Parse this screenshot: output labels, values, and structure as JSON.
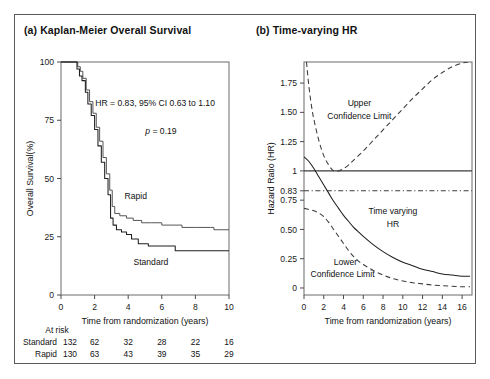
{
  "figure": {
    "panel_a_title": "(a) Kaplan-Meier Overall Survival",
    "panel_b_title": "(b) Time-varying HR"
  },
  "chart_data": [
    {
      "type": "line",
      "panel": "a",
      "title": "(a) Kaplan-Meier Overall Survival",
      "xlabel": "Time from randomization (years)",
      "ylabel": "Overall Survival(%)",
      "xlim": [
        0,
        10
      ],
      "ylim": [
        0,
        100
      ],
      "xticks": [
        0,
        2,
        4,
        6,
        8,
        10
      ],
      "yticks": [
        0,
        25,
        50,
        75,
        100
      ],
      "grid": false,
      "legend_position": "inline-labels",
      "annotations": [
        "HR = 0.83, 95% CI 0.63 to 1.10",
        "p = 0.19"
      ],
      "annotation_hr": "HR = 0.83, 95% CI 0.63 to 1.10",
      "annotation_p_italic": "p",
      "annotation_p_rest": " = 0.19",
      "series": [
        {
          "name": "Rapid",
          "label": "Rapid",
          "style": "solid",
          "points": [
            [
              0.0,
              100
            ],
            [
              0.9,
              100
            ],
            [
              1.0,
              98
            ],
            [
              1.15,
              96
            ],
            [
              1.3,
              93
            ],
            [
              1.5,
              88
            ],
            [
              1.7,
              83
            ],
            [
              1.9,
              78
            ],
            [
              2.1,
              72
            ],
            [
              2.3,
              66
            ],
            [
              2.5,
              59
            ],
            [
              2.7,
              52
            ],
            [
              2.9,
              45
            ],
            [
              3.05,
              38
            ],
            [
              3.2,
              35
            ],
            [
              3.5,
              34
            ],
            [
              3.9,
              33
            ],
            [
              4.3,
              32
            ],
            [
              4.8,
              31
            ],
            [
              5.4,
              31
            ],
            [
              6.0,
              30
            ],
            [
              6.6,
              30
            ],
            [
              7.2,
              29
            ],
            [
              8.0,
              29
            ],
            [
              8.9,
              29
            ],
            [
              9.1,
              28
            ],
            [
              10.0,
              28
            ]
          ]
        },
        {
          "name": "Standard",
          "label": "Standard",
          "style": "solid",
          "points": [
            [
              0.0,
              100
            ],
            [
              0.85,
              100
            ],
            [
              0.95,
              97
            ],
            [
              1.1,
              94
            ],
            [
              1.25,
              92
            ],
            [
              1.45,
              87
            ],
            [
              1.6,
              82
            ],
            [
              1.8,
              77
            ],
            [
              2.0,
              71
            ],
            [
              2.2,
              64
            ],
            [
              2.4,
              57
            ],
            [
              2.6,
              50
            ],
            [
              2.8,
              43
            ],
            [
              2.95,
              33
            ],
            [
              3.1,
              30
            ],
            [
              3.3,
              28
            ],
            [
              3.6,
              27
            ],
            [
              3.9,
              26
            ],
            [
              4.2,
              24
            ],
            [
              4.6,
              22
            ],
            [
              5.2,
              21
            ],
            [
              5.9,
              21
            ],
            [
              6.5,
              21
            ],
            [
              6.8,
              19
            ],
            [
              8.0,
              19
            ],
            [
              10.0,
              19
            ]
          ]
        }
      ],
      "at_risk": {
        "header": "At risk",
        "times": [
          0,
          2,
          4,
          6,
          8,
          10
        ],
        "rows": [
          {
            "label": "Standard",
            "counts": [
              132,
              62,
              32,
              28,
              22,
              16
            ]
          },
          {
            "label": "Rapid",
            "counts": [
              130,
              63,
              43,
              39,
              35,
              29
            ]
          }
        ]
      }
    },
    {
      "type": "line",
      "panel": "b",
      "title": "(b) Time-varying HR",
      "xlabel": "Time from randomization (years)",
      "ylabel": "Hazard Ratio (HR)",
      "xlim": [
        0,
        17
      ],
      "ylim": [
        -0.06,
        1.93
      ],
      "xticks": [
        0,
        2,
        4,
        6,
        8,
        10,
        12,
        14,
        16
      ],
      "yticks": [
        0,
        0.25,
        0.5,
        0.75,
        0.83,
        1,
        1.25,
        1.5,
        1.75
      ],
      "ytick_labels": [
        "0",
        "0.25",
        "0.50",
        "0.75",
        "0.83",
        "1",
        "1.25",
        "1.50",
        "1.75"
      ],
      "grid": false,
      "reference_lines": [
        {
          "name": "null-effect",
          "value": 1,
          "style": "solid"
        },
        {
          "name": "overall-hr",
          "value": 0.83,
          "style": "dash-dot"
        }
      ],
      "series": [
        {
          "name": "Upper Confidence Limit",
          "label": "Upper\nConfidence Limit",
          "label_line1": "Upper",
          "label_line2": "Confidence Limit",
          "style": "dashed",
          "points": [
            [
              0.25,
              1.93
            ],
            [
              0.5,
              1.72
            ],
            [
              0.75,
              1.56
            ],
            [
              1.0,
              1.44
            ],
            [
              1.5,
              1.26
            ],
            [
              2.0,
              1.13
            ],
            [
              2.5,
              1.05
            ],
            [
              3.0,
              1.0
            ],
            [
              3.5,
              1.0
            ],
            [
              4.0,
              1.02
            ],
            [
              4.5,
              1.05
            ],
            [
              5.0,
              1.09
            ],
            [
              6.0,
              1.17
            ],
            [
              7.0,
              1.26
            ],
            [
              8.0,
              1.35
            ],
            [
              9.0,
              1.44
            ],
            [
              10.0,
              1.53
            ],
            [
              11.0,
              1.62
            ],
            [
              12.0,
              1.7
            ],
            [
              13.0,
              1.78
            ],
            [
              14.0,
              1.84
            ],
            [
              15.0,
              1.89
            ],
            [
              16.0,
              1.92
            ],
            [
              16.6,
              1.93
            ]
          ]
        },
        {
          "name": "Time varying HR",
          "label_line1": "Time varying",
          "label_line2": "HR",
          "style": "solid",
          "points": [
            [
              0.0,
              1.12
            ],
            [
              0.5,
              1.08
            ],
            [
              1.0,
              1.02
            ],
            [
              1.5,
              0.95
            ],
            [
              2.0,
              0.88
            ],
            [
              2.5,
              0.81
            ],
            [
              3.0,
              0.74
            ],
            [
              3.5,
              0.68
            ],
            [
              4.0,
              0.62
            ],
            [
              4.5,
              0.57
            ],
            [
              5.0,
              0.52
            ],
            [
              5.5,
              0.48
            ],
            [
              6.0,
              0.44
            ],
            [
              7.0,
              0.37
            ],
            [
              8.0,
              0.31
            ],
            [
              9.0,
              0.26
            ],
            [
              10.0,
              0.22
            ],
            [
              11.0,
              0.19
            ],
            [
              12.0,
              0.16
            ],
            [
              13.0,
              0.14
            ],
            [
              14.0,
              0.12
            ],
            [
              15.0,
              0.11
            ],
            [
              16.0,
              0.1
            ],
            [
              16.8,
              0.1
            ]
          ]
        },
        {
          "name": "Lower Confidence Limit",
          "label_line1": "Lower",
          "label_line2": "Confidence Limit",
          "style": "dashed",
          "points": [
            [
              0.0,
              0.68
            ],
            [
              0.5,
              0.67
            ],
            [
              1.0,
              0.66
            ],
            [
              1.5,
              0.64
            ],
            [
              2.0,
              0.61
            ],
            [
              2.5,
              0.56
            ],
            [
              3.0,
              0.5
            ],
            [
              3.5,
              0.44
            ],
            [
              4.0,
              0.38
            ],
            [
              4.5,
              0.32
            ],
            [
              5.0,
              0.27
            ],
            [
              5.5,
              0.23
            ],
            [
              6.0,
              0.2
            ],
            [
              7.0,
              0.15
            ],
            [
              8.0,
              0.11
            ],
            [
              9.0,
              0.08
            ],
            [
              10.0,
              0.06
            ],
            [
              11.0,
              0.045
            ],
            [
              12.0,
              0.035
            ],
            [
              13.0,
              0.025
            ],
            [
              14.0,
              0.02
            ],
            [
              15.0,
              0.015
            ],
            [
              16.0,
              0.01
            ],
            [
              16.8,
              0.01
            ]
          ]
        }
      ]
    }
  ]
}
